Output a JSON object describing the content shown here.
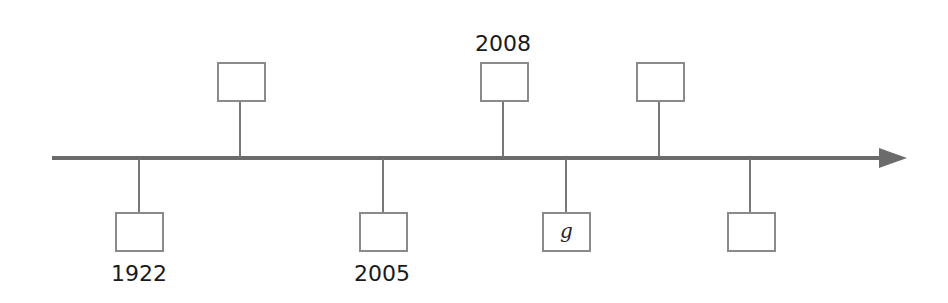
{
  "timeline": {
    "axis": {
      "color": "#6b6b6b",
      "direction": "right-arrow"
    },
    "events": [
      {
        "id": "e1",
        "position": "below",
        "stem_x": 139,
        "box_text": "",
        "label": "1922"
      },
      {
        "id": "e2",
        "position": "above",
        "stem_x": 240,
        "box_text": "",
        "label": ""
      },
      {
        "id": "e3",
        "position": "below",
        "stem_x": 383,
        "box_text": "",
        "label": "2005"
      },
      {
        "id": "e4",
        "position": "above",
        "stem_x": 503,
        "box_text": "",
        "label": "2008"
      },
      {
        "id": "e5",
        "position": "below",
        "stem_x": 566,
        "box_text": "g",
        "label": ""
      },
      {
        "id": "e6",
        "position": "above",
        "stem_x": 659,
        "box_text": "",
        "label": ""
      },
      {
        "id": "e7",
        "position": "below",
        "stem_x": 750,
        "box_text": "",
        "label": ""
      }
    ]
  }
}
